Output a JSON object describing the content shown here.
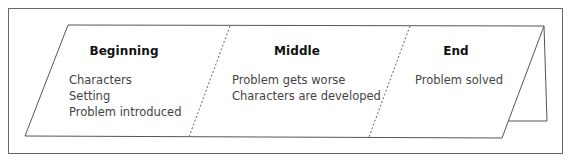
{
  "diagram": {
    "type": "folded story card",
    "sections": [
      {
        "title": "Beginning",
        "items": [
          "Characters",
          "Setting",
          "Problem introduced"
        ]
      },
      {
        "title": "Middle",
        "items": [
          "Problem gets worse",
          "Characters are developed"
        ]
      },
      {
        "title": "End",
        "items": [
          "Problem solved"
        ]
      }
    ],
    "colors": {
      "line": "#555555",
      "frame": "#666666",
      "heading_text": "#111111",
      "body_text": "#444444",
      "background": "#ffffff"
    }
  }
}
